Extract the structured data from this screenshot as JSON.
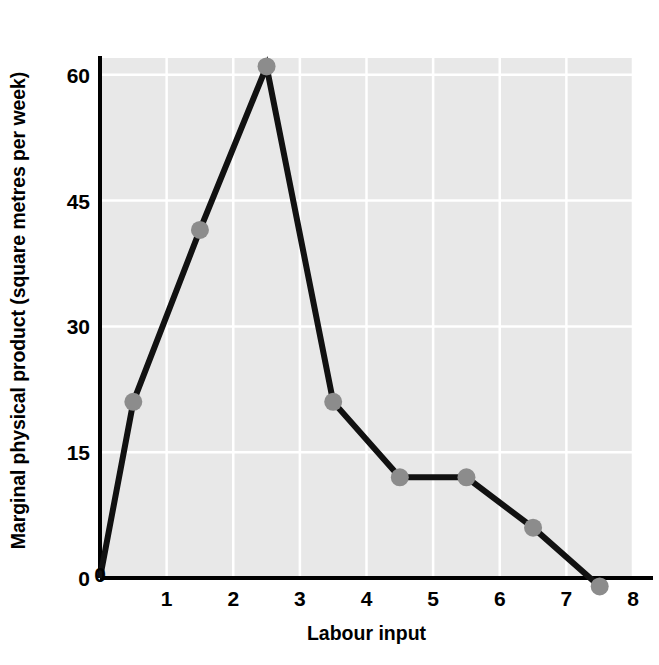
{
  "chart_data": {
    "type": "line",
    "title": "",
    "xlabel": "Labour input",
    "ylabel": "Marginal physical product (square metres per week)",
    "x": [
      0.5,
      1.5,
      2.5,
      3.5,
      4.5,
      5.5,
      6.5,
      7.5
    ],
    "values": [
      21,
      41.5,
      61,
      21,
      12,
      12,
      6,
      -1
    ],
    "series": [
      {
        "name": "Marginal physical product",
        "x": [
          0.5,
          1.5,
          2.5,
          3.5,
          4.5,
          5.5,
          6.5,
          7.5
        ],
        "values": [
          21,
          41.5,
          61,
          21,
          12,
          12,
          6,
          -1
        ]
      }
    ],
    "line_origin": {
      "x": 0,
      "y": 0
    },
    "xlim": [
      0,
      8
    ],
    "ylim": [
      0,
      62
    ],
    "xticks": [
      "0",
      "1",
      "2",
      "3",
      "4",
      "5",
      "6",
      "7",
      "8"
    ],
    "xtick_values": [
      0,
      1,
      2,
      3,
      4,
      5,
      6,
      7,
      8
    ],
    "yticks": [
      "0",
      "15",
      "30",
      "45",
      "60"
    ],
    "ytick_values": [
      0,
      15,
      30,
      45,
      60
    ],
    "grid": true,
    "legend": "none",
    "marker": "circle",
    "colors": {
      "line": "#111111",
      "marker": "#8c8c8c",
      "plot_background": "#e8e8e8",
      "gridline": "#ffffff",
      "axis": "#000000",
      "text": "#000000",
      "page_background": "#ffffff"
    }
  },
  "axis_titles": {
    "y": "Marginal physical product (square metres per week)",
    "x": "Labour input"
  }
}
